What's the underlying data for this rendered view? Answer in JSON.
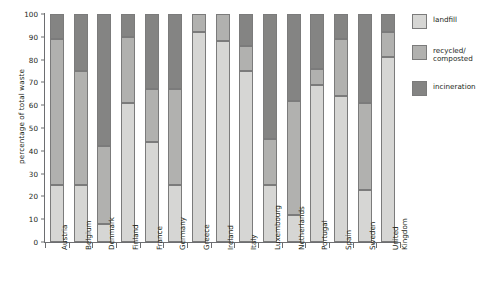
{
  "chart_data": {
    "type": "bar",
    "subtype": "stacked-vertical-100",
    "title": "",
    "xlabel": "",
    "ylabel": "percentage of total waste",
    "ylim": [
      0,
      100
    ],
    "yticks": [
      0,
      10,
      20,
      30,
      40,
      50,
      60,
      70,
      80,
      90,
      100
    ],
    "grid": false,
    "legend_position": "right",
    "categories": [
      "Austria",
      "Belgium",
      "Denmark",
      "Finland",
      "France",
      "Germany",
      "Greece",
      "Ireland",
      "Italy",
      "Luxembourg",
      "Netherlands",
      "Portugal",
      "Spain",
      "Sweden",
      "United Kingdom"
    ],
    "series": [
      {
        "name": "landfill",
        "color": "#d6d6d4",
        "values": [
          25,
          25,
          8,
          61,
          44,
          25,
          92,
          88,
          75,
          25,
          12,
          69,
          64,
          23,
          81
        ]
      },
      {
        "name": "recycled/ composted",
        "color": "#b1b1af",
        "values": [
          64,
          50,
          34,
          29,
          23,
          42,
          8,
          12,
          11,
          20,
          50,
          7,
          25,
          38,
          11
        ]
      },
      {
        "name": "incineration",
        "color": "#848483",
        "values": [
          11,
          25,
          58,
          10,
          33,
          33,
          0,
          0,
          14,
          55,
          38,
          24,
          11,
          39,
          8
        ]
      }
    ]
  },
  "legend": {
    "items": [
      {
        "label": "landfill",
        "key": "landfill"
      },
      {
        "label": "recycled/\ncomposted",
        "key": "recycled"
      },
      {
        "label": "incineration",
        "key": "incin"
      }
    ]
  }
}
